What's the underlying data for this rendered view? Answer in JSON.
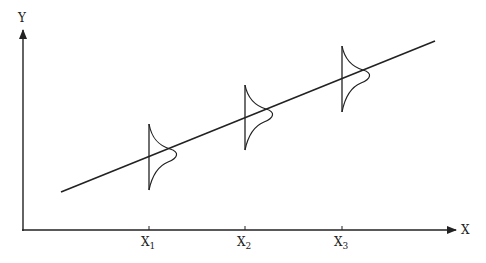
{
  "diagram": {
    "type": "regression-with-conditional-distributions",
    "axes": {
      "x_label": "X",
      "y_label": "Y"
    },
    "ticks": [
      {
        "base": "X",
        "sub": "1"
      },
      {
        "base": "X",
        "sub": "2"
      },
      {
        "base": "X",
        "sub": "3"
      }
    ],
    "colors": {
      "ink": "#222222",
      "background": "#ffffff"
    }
  }
}
